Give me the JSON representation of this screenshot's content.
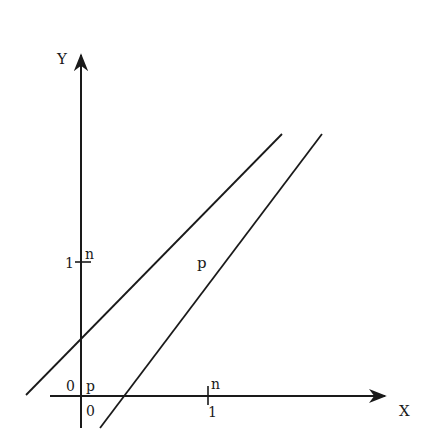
{
  "diagram": {
    "axes": {
      "x_label": "X",
      "y_label": "Y"
    },
    "ticks": {
      "x_one": "1",
      "y_one": "1",
      "x_one_marker": "n",
      "y_one_marker": "n"
    },
    "origin": {
      "left_label": "0",
      "right_label": "p",
      "below_label": "0"
    },
    "lines": [
      {
        "name": "upper-line",
        "label": ""
      },
      {
        "name": "lower-line",
        "label": "p"
      }
    ],
    "colors": {
      "ink": "#1a1a1a",
      "background": "#ffffff"
    }
  }
}
